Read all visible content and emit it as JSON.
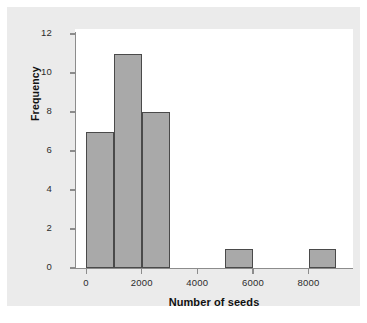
{
  "chart_data": {
    "type": "bar",
    "title": "",
    "subtitle": "",
    "xlabel": "Number of seeds",
    "ylabel": "Frequency",
    "xlim": [
      -400,
      9600
    ],
    "ylim": [
      0,
      12.5
    ],
    "grid": false,
    "legend": null,
    "bin_width": 1000,
    "bin_starts": [
      0,
      1000,
      2000,
      3000,
      4000,
      5000,
      6000,
      7000,
      8000
    ],
    "bin_labels": [
      "0-1000",
      "1000-2000",
      "2000-3000",
      "3000-4000",
      "4000-5000",
      "5000-6000",
      "6000-7000",
      "7000-8000",
      "8000-9000"
    ],
    "values": [
      7,
      11,
      8,
      0,
      0,
      1,
      0,
      0,
      1
    ],
    "categories": [
      "0",
      "1000",
      "2000",
      "3000",
      "4000",
      "5000",
      "6000",
      "7000",
      "8000"
    ],
    "xticks": [
      0,
      2000,
      4000,
      6000,
      8000
    ],
    "xtick_labels": [
      "0",
      "2000",
      "4000",
      "6000",
      "8000"
    ],
    "yticks": [
      0,
      2,
      4,
      6,
      8,
      10,
      12
    ],
    "ytick_labels": [
      "0",
      "2",
      "4",
      "6",
      "8",
      "10",
      "12"
    ],
    "colors": {
      "bar_fill": "#a9a9a9",
      "bar_edge": "#4a4a4a",
      "axis": "#8c8c8c",
      "text": "#2b2b2b",
      "label_text": "#111111",
      "plot_background": "#ffffff",
      "figure_background": "#ebebeb",
      "page_background": "#ffffff"
    }
  }
}
